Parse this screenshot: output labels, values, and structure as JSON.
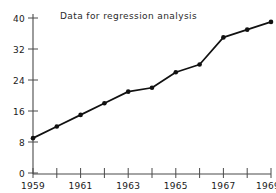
{
  "chart_data": {
    "type": "line",
    "title": "Data for regression analysis",
    "xlabel": "",
    "ylabel": "",
    "categories": [
      "1959",
      "1960",
      "1961",
      "1962",
      "1963",
      "1964",
      "1965",
      "1966",
      "1967",
      "1968",
      "1969"
    ],
    "x": [
      1959,
      1960,
      1961,
      1962,
      1963,
      1964,
      1965,
      1966,
      1967,
      1968,
      1969
    ],
    "values": [
      9,
      12,
      15,
      18,
      21,
      22,
      26,
      28,
      35,
      37,
      39
    ],
    "xlim": [
      1959,
      1969
    ],
    "ylim": [
      0,
      40
    ],
    "y_ticks": [
      0,
      8,
      16,
      24,
      32,
      40
    ],
    "y_tick_labels": [
      "0",
      "8",
      "16",
      "24",
      "32",
      "40"
    ],
    "x_ticks": [
      1959,
      1960,
      1961,
      1962,
      1963,
      1964,
      1965,
      1966,
      1967,
      1968,
      1969
    ],
    "x_tick_labels": [
      "1959",
      "",
      "1961",
      "",
      "1963",
      "",
      "1965",
      "",
      "1967",
      "",
      "1969"
    ],
    "x_labeled_ticks": [
      "1959",
      "1961",
      "1963",
      "1965",
      "1967",
      "1969"
    ],
    "grid": false,
    "legend": null,
    "legend_position": "none",
    "marker": "filled-circle",
    "line_color": "#111111",
    "marker_color": "#111111",
    "axis_color": "#4a4a4a",
    "background_color": "#ffffff"
  },
  "figure": {
    "title_text": "Data for regression analysis",
    "marker_shape_name": "filled-circle-marker"
  }
}
